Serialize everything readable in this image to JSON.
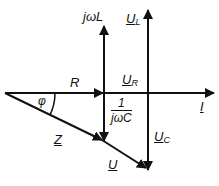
{
  "diagram": {
    "colors": {
      "stroke": "#111111",
      "background": "#ffffff"
    },
    "labels": {
      "jwL": "jωL",
      "U_L_main": "U",
      "U_L_sub": "L",
      "R": "R",
      "U_R_main": "U",
      "U_R_sub": "R",
      "phi": "φ",
      "frac_num": "1",
      "frac_den": "jωC",
      "I": "I",
      "U_C_main": "U",
      "U_C_sub": "C",
      "Z": "Z",
      "U": "U"
    }
  }
}
